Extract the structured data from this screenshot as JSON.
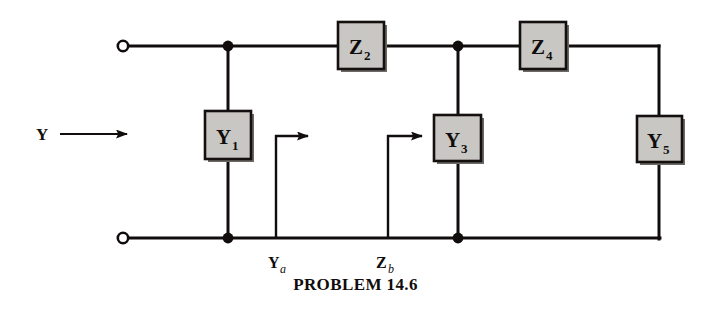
{
  "figure": {
    "caption": "PROBLEM 14.6",
    "source_label": "Y",
    "colors": {
      "ink": "#100d0c",
      "box_fill": "#c9c7c4",
      "box_border": "#13100f",
      "box_shadow": "#6d6a66",
      "background": "#ffffff"
    },
    "components": [
      {
        "id": "Y1",
        "letter": "Y",
        "subscript": "1",
        "x": 205,
        "y": 111,
        "w": 46,
        "h": 48,
        "orientation": "vertical"
      },
      {
        "id": "Z2",
        "letter": "Z",
        "subscript": "2",
        "x": 338,
        "y": 22,
        "w": 46,
        "h": 47,
        "orientation": "horizontal"
      },
      {
        "id": "Y3",
        "letter": "Y",
        "subscript": "3",
        "x": 434,
        "y": 115,
        "w": 47,
        "h": 46,
        "orientation": "vertical"
      },
      {
        "id": "Z4",
        "letter": "Z",
        "subscript": "4",
        "x": 520,
        "y": 22,
        "w": 46,
        "h": 47,
        "orientation": "horizontal"
      },
      {
        "id": "Y5",
        "letter": "Y",
        "subscript": "5",
        "x": 637,
        "y": 116,
        "w": 45,
        "h": 46,
        "orientation": "vertical"
      }
    ],
    "node_labels": [
      {
        "id": "Ya",
        "letter": "Y",
        "subscript": "a",
        "x": 278,
        "y": 266
      },
      {
        "id": "Zb",
        "letter": "Z",
        "subscript": "b",
        "x": 385,
        "y": 266
      }
    ],
    "terminals": [
      {
        "id": "top-left-terminal",
        "x": 123,
        "y": 46
      },
      {
        "id": "bottom-left-terminal",
        "x": 123,
        "y": 238
      }
    ],
    "junction_dots": [
      {
        "id": "top-node-y1",
        "x": 228,
        "y": 46
      },
      {
        "id": "top-node-y3",
        "x": 458,
        "y": 46
      },
      {
        "id": "bottom-node-y1",
        "x": 228,
        "y": 238
      },
      {
        "id": "bottom-node-y3",
        "x": 458,
        "y": 238
      }
    ]
  }
}
